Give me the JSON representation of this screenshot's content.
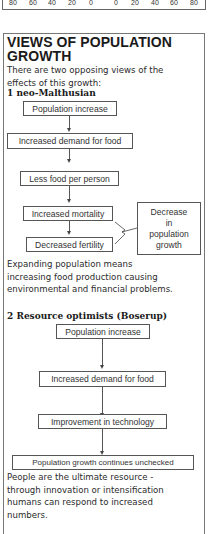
{
  "axis": {
    "ticks_left": [
      "80",
      "60",
      "40",
      "20",
      "0"
    ],
    "ticks_right": [
      "0",
      "20",
      "40",
      "60",
      "80"
    ]
  },
  "section": {
    "title_line1": "VIEWS OF POPULATION",
    "title_line2": "GROWTH",
    "intro_line1": "There are two opposing views of the",
    "intro_line2": "effects of this growth:"
  },
  "view1": {
    "heading": "1  neo-Malthusian",
    "boxes": [
      "Population increase",
      "Increased demand for food",
      "Less food per person",
      "Increased mortality",
      "Decreased fertility"
    ],
    "outcome_lines": [
      "Decrease",
      "in",
      "population",
      "growth"
    ],
    "summary_lines": [
      "Expanding population means",
      "increasing food production causing",
      "environmental and financial problems."
    ]
  },
  "view2": {
    "heading": "2  Resource optimists (Boserup)",
    "boxes": [
      "Population increase",
      "Increased demand for food",
      "Improvement in technology",
      "Population growth continues unchecked"
    ],
    "summary_lines": [
      "People are the ultimate resource -",
      "through innovation or intensification",
      "humans can respond to increased",
      "numbers."
    ]
  }
}
